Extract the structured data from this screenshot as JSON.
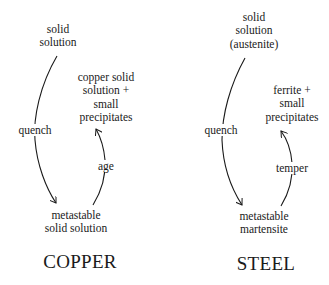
{
  "copper": {
    "title": "COPPER",
    "start_state": [
      "solid",
      "solution"
    ],
    "end_state": [
      "copper solid",
      "solution +",
      "small",
      "precipitates"
    ],
    "intermediate_state": [
      "metastable",
      "solid solution"
    ],
    "step1_label": "quench",
    "step2_label": "age"
  },
  "steel": {
    "title": "STEEL",
    "start_state": [
      "solid",
      "solution",
      "(austenite)"
    ],
    "end_state": [
      "ferrite +",
      "small",
      "precipitates"
    ],
    "intermediate_state": [
      "metastable",
      "martensite"
    ],
    "step1_label": "quench",
    "step2_label": "temper"
  },
  "colors": {
    "ink": "#1a1a1a",
    "background": "#ffffff"
  }
}
